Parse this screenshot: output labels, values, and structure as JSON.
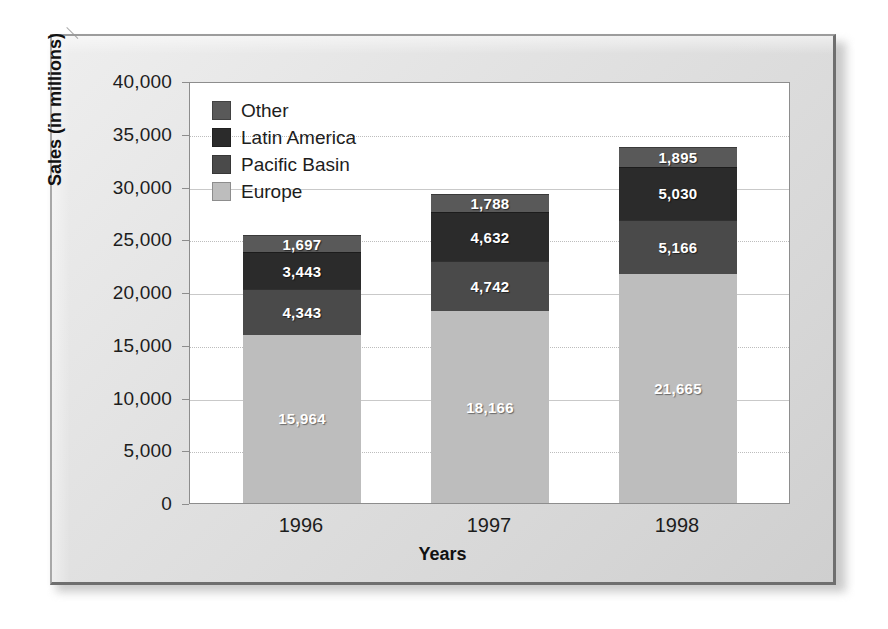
{
  "chart_data": {
    "type": "bar",
    "subtype": "stacked-column",
    "title": "",
    "xlabel": "Years",
    "ylabel": "Sales (in millions)",
    "categories": [
      "1996",
      "1997",
      "1998"
    ],
    "ylim": [
      0,
      40000
    ],
    "ytick_labels": [
      "0",
      "5,000",
      "10,000",
      "15,000",
      "20,000",
      "25,000",
      "30,000",
      "35,000",
      "40,000"
    ],
    "ytick_values": [
      0,
      5000,
      10000,
      15000,
      20000,
      25000,
      30000,
      35000,
      40000
    ],
    "grid": true,
    "legend_position": "top-left-inside",
    "stack_order_bottom_to_top": [
      "Europe",
      "Pacific Basin",
      "Latin America",
      "Other"
    ],
    "series": [
      {
        "name": "Europe",
        "color": "#bdbdbd",
        "values": [
          15964,
          18166,
          21665
        ],
        "labels": [
          "15,964",
          "18,166",
          "21,665"
        ]
      },
      {
        "name": "Pacific Basin",
        "color": "#4a4a4a",
        "values": [
          4343,
          4742,
          5166
        ],
        "labels": [
          "4,343",
          "4,742",
          "5,166"
        ]
      },
      {
        "name": "Latin America",
        "color": "#2b2b2b",
        "values": [
          3443,
          4632,
          5030
        ],
        "labels": [
          "3,443",
          "4,632",
          "5,030"
        ]
      },
      {
        "name": "Other",
        "color": "#595959",
        "values": [
          1697,
          1788,
          1895
        ],
        "labels": [
          "1,697",
          "1,788",
          "1,895"
        ]
      }
    ],
    "legend_entries": [
      {
        "label": "Other",
        "color": "#595959"
      },
      {
        "label": "Latin America",
        "color": "#2b2b2b"
      },
      {
        "label": "Pacific Basin",
        "color": "#4a4a4a"
      },
      {
        "label": "Europe",
        "color": "#bdbdbd"
      }
    ],
    "totals": [
      25447,
      29328,
      33756
    ]
  }
}
